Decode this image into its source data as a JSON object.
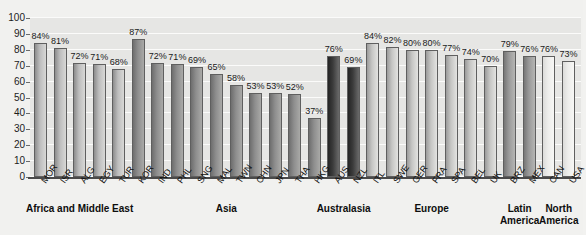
{
  "chart_data": {
    "type": "bar",
    "title": "",
    "subtitle": "",
    "xlabel": "",
    "ylabel": "",
    "ylim": [
      0,
      100
    ],
    "grid": true,
    "legend_position": "none",
    "value_suffix": "%",
    "yticks": [
      0,
      10,
      20,
      30,
      40,
      50,
      60,
      70,
      80,
      90,
      100
    ],
    "categories": [
      "MOR",
      "ISR",
      "ALG",
      "EGY",
      "TUR",
      "KOR",
      "IND",
      "PHL",
      "SNG",
      "MAL",
      "TWN",
      "CHN",
      "JPN",
      "THA",
      "HKG",
      "AUS",
      "NZL",
      "ITL",
      "SWE",
      "GER",
      "FRA",
      "SPA",
      "BEL",
      "UK",
      "BRZ",
      "MEX",
      "CAN",
      "USA"
    ],
    "values": [
      84,
      81,
      72,
      71,
      68,
      87,
      72,
      71,
      69,
      65,
      58,
      53,
      53,
      52,
      37,
      76,
      69,
      84,
      82,
      80,
      80,
      77,
      74,
      70,
      79,
      76,
      76,
      73
    ],
    "value_labels": [
      "84%",
      "81%",
      "72%",
      "71%",
      "68%",
      "87%",
      "72%",
      "71%",
      "69%",
      "65%",
      "58%",
      "53%",
      "53%",
      "52%",
      "37%",
      "76%",
      "69%",
      "84%",
      "82%",
      "80%",
      "80%",
      "77%",
      "74%",
      "70%",
      "79%",
      "76%",
      "76%",
      "73%"
    ],
    "groups": [
      {
        "name": "Africa and Middle East",
        "label": "Africa and Middle East",
        "start": 0,
        "count": 5,
        "shade": "africa",
        "color": "#bdbdbd"
      },
      {
        "name": "Asia",
        "label": "Asia",
        "start": 5,
        "count": 10,
        "shade": "asia",
        "color": "#8e8e8e"
      },
      {
        "name": "Australasia",
        "label": "Australasia",
        "start": 15,
        "count": 2,
        "shade": "australasia",
        "color": "#3c3c3c"
      },
      {
        "name": "Europe",
        "label": "Europe",
        "start": 17,
        "count": 7,
        "shade": "europe",
        "color": "#c6c6c4"
      },
      {
        "name": "Latin America",
        "label": "Latin\nAmerica",
        "start": 24,
        "count": 2,
        "shade": "latin",
        "color": "#9a9a9a"
      },
      {
        "name": "North America",
        "label": "North\nAmerica",
        "start": 26,
        "count": 2,
        "shade": "north",
        "color": "#ededeb"
      }
    ]
  },
  "colors": {
    "background": "#f1f1ef",
    "plot_background": "#e6e6e4",
    "gridline": "#fbfbfa",
    "axis": "#4a4a4a",
    "text": "#111111"
  }
}
